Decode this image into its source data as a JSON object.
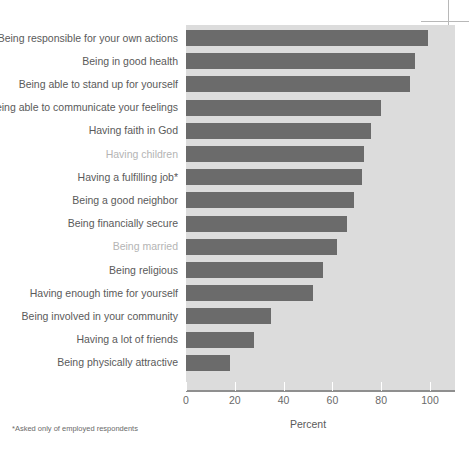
{
  "chart_data": {
    "type": "bar",
    "orientation": "horizontal",
    "title": "",
    "xlabel": "Percent",
    "ylabel": "",
    "xlim": [
      0,
      100
    ],
    "xticks": [
      0,
      20,
      40,
      60,
      80,
      100
    ],
    "grid": false,
    "legend": null,
    "bar_color": "#6b6b6b",
    "plot_background": "#dcdcdc",
    "footnote": "*Asked only of employed respondents",
    "categories": [
      "Being responsible for your own actions",
      "Being in good health",
      "Being able to stand up for yourself",
      "Being able to communicate your feelings",
      "Having faith in God",
      "Having children",
      "Having a fulfilling job*",
      "Being a good neighbor",
      "Being financially secure",
      "Being married",
      "Being religious",
      "Having enough time for yourself",
      "Being involved in your community",
      "Having a lot of friends",
      "Being physically attractive"
    ],
    "values": [
      99,
      94,
      92,
      80,
      76,
      73,
      72,
      69,
      66,
      62,
      56,
      52,
      35,
      28,
      18
    ],
    "label_styles": [
      "normal",
      "normal",
      "normal",
      "normal",
      "normal",
      "muted",
      "normal",
      "normal",
      "normal",
      "muted",
      "normal",
      "normal",
      "normal",
      "normal",
      "normal"
    ],
    "tick_labels": [
      "0",
      "20",
      "40",
      "60",
      "80",
      "100"
    ]
  }
}
